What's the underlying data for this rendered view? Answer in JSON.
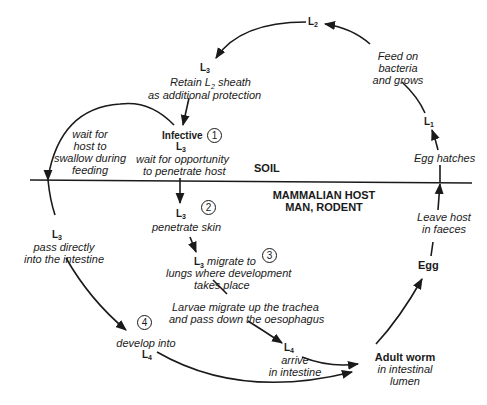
{
  "diagram": {
    "regions": {
      "soil": "SOIL",
      "host_line1": "MAMMALIAN HOST",
      "host_line2": "MAN, RODENT"
    },
    "stages": {
      "l2": {
        "base": "L",
        "sub": "2"
      },
      "l3_sheath": {
        "base": "L",
        "sub": "3"
      },
      "l1": {
        "base": "L",
        "sub": "1"
      },
      "infective_word": "Infective",
      "infective_l3": {
        "base": "L",
        "sub": "3"
      },
      "l3_oral": {
        "base": "L",
        "sub": "3"
      },
      "l3_skin": {
        "base": "L",
        "sub": "3"
      },
      "l3_lungs": {
        "base": "L",
        "sub": "3"
      },
      "l4_trachea": {
        "base": "L",
        "sub": "4"
      },
      "l4_direct": {
        "base": "L",
        "sub": "4"
      },
      "egg": "Egg",
      "adult": "Adult worm"
    },
    "notes": {
      "sheath_line1": "Retain L",
      "sheath_sub": "2",
      "sheath_line1_end": " sheath",
      "sheath_line2": "as additional protection",
      "feed_line1": "Feed on",
      "feed_line2": "bacteria",
      "feed_line3": "and grows",
      "egg_hatches": "Egg hatches",
      "wait_swallow_line1": "wait for",
      "wait_swallow_line2": "host to",
      "wait_swallow_line3": "swallow during",
      "wait_swallow_line4": "feeding",
      "wait_penetrate_line1": "wait for opportunity",
      "wait_penetrate_line2": "to penetrate host",
      "penetrate_skin": "penetrate skin",
      "migrate_line1": " migrate to",
      "migrate_line2": "lungs where development",
      "migrate_line3": "takes place",
      "trachea_line1": "Larvae migrate up the trachea",
      "trachea_line2": "and pass down the oesophagus",
      "arrive_line1": "arrive",
      "arrive_line2": "in intestine",
      "intestine_line1": "in intestinal",
      "intestine_line2": "lumen",
      "leave_line1": "Leave host",
      "leave_line2": "in faeces",
      "pass_line1": "pass directly",
      "pass_line2": "into the intestine",
      "develop_into": "develop into"
    },
    "step_markers": [
      "1",
      "2",
      "3",
      "4"
    ],
    "colors": {
      "ink": "#1a1a1a",
      "background": "#ffffff"
    }
  }
}
